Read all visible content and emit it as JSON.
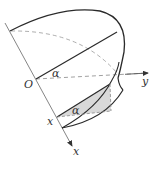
{
  "diagram": {
    "type": "solid-geometry",
    "labels": {
      "origin": "O",
      "x_axis": "x",
      "y_axis": "y",
      "angle_top": "α",
      "angle_bottom": "α",
      "x_position": "x"
    },
    "colors": {
      "stroke": "#2a2a2a",
      "axis": "#777777",
      "dashed": "#8a8a8a",
      "shade": "#d9d9d9"
    }
  }
}
